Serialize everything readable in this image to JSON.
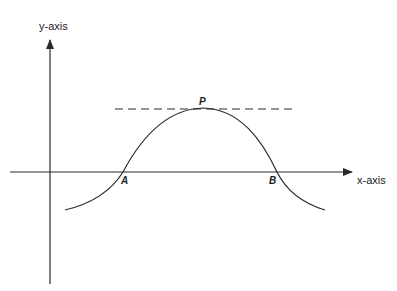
{
  "diagram": {
    "y_axis_label": "y-axis",
    "x_axis_label": "x-axis",
    "point_labels": {
      "peak": "P",
      "left_root": "A",
      "right_root": "B"
    },
    "colors": {
      "line": "#2a2a2a",
      "background": "#ffffff"
    }
  }
}
